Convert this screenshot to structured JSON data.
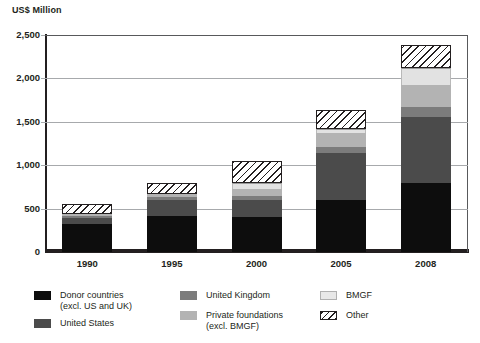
{
  "chart_data": {
    "type": "bar",
    "subtype": "stacked-bar",
    "title": "",
    "ylabel": "US$ Million",
    "xlabel": "",
    "categories": [
      "1990",
      "1995",
      "2000",
      "2005",
      "2008"
    ],
    "ylim": [
      0,
      2500
    ],
    "yticks": [
      0,
      500,
      1000,
      1500,
      2000,
      2500
    ],
    "ytick_labels": [
      "0",
      "500",
      "1,000",
      "1,500",
      "2,000",
      "2,500"
    ],
    "grid": true,
    "grid_axis": "y",
    "legend_position": "bottom",
    "series": [
      {
        "name": "Donor countries (excl. US and UK)",
        "color": "#0d0d0d",
        "pattern": "solid",
        "values": [
          320,
          420,
          400,
          600,
          800
        ]
      },
      {
        "name": "United States",
        "color": "#4b4b4b",
        "pattern": "solid",
        "values": [
          70,
          180,
          200,
          540,
          760
        ]
      },
      {
        "name": "United Kingdom",
        "color": "#7c7c7c",
        "pattern": "solid",
        "values": [
          25,
          30,
          50,
          70,
          110
        ]
      },
      {
        "name": "Private foundations (excl. BMGF)",
        "color": "#b3b3b3",
        "pattern": "solid",
        "values": [
          25,
          40,
          80,
          160,
          260
        ]
      },
      {
        "name": "BMGF",
        "color": "#e2e2e2",
        "pattern": "solid",
        "values": [
          0,
          0,
          60,
          50,
          190
        ]
      },
      {
        "name": "Other",
        "color": "#ffffff",
        "pattern": "diagonal-hatch",
        "values": [
          110,
          130,
          260,
          220,
          260
        ]
      }
    ],
    "totals": [
      550,
      800,
      1050,
      1640,
      2380
    ]
  },
  "axis": {
    "y_title": "US$ Million",
    "y_tick_labels": [
      "2,500",
      "2,000",
      "1,500",
      "1,000",
      "500",
      "0"
    ],
    "x_tick_labels": [
      "1990",
      "1995",
      "2000",
      "2005",
      "2008"
    ]
  },
  "legend": {
    "columns": [
      {
        "items": [
          {
            "label": "Donor countries\n(excl. US and UK)",
            "swatch": "sw-donor",
            "color": "#0d0d0d"
          },
          {
            "label": "United States",
            "swatch": "sw-us",
            "color": "#4b4b4b"
          }
        ]
      },
      {
        "items": [
          {
            "label": "United Kingdom",
            "swatch": "sw-uk",
            "color": "#7c7c7c"
          },
          {
            "label": "Private foundations\n(excl. BMGF)",
            "swatch": "sw-priv",
            "color": "#b3b3b3"
          }
        ]
      },
      {
        "items": [
          {
            "label": "BMGF",
            "swatch": "sw-bmgf",
            "color": "#e8e8e8"
          },
          {
            "label": "Other",
            "swatch": "sw-other",
            "color": "#ffffff"
          }
        ]
      }
    ]
  }
}
